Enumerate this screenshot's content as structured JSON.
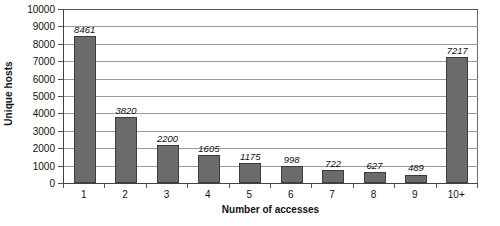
{
  "chart_data": {
    "type": "bar",
    "title": "",
    "xlabel": "Number of accesses",
    "ylabel": "Unique hosts",
    "categories": [
      "1",
      "2",
      "3",
      "4",
      "5",
      "6",
      "7",
      "8",
      "9",
      "10+"
    ],
    "values": [
      8461,
      3820,
      2200,
      1605,
      1175,
      998,
      722,
      627,
      489,
      7217
    ],
    "data_labels": [
      "8461",
      "3820",
      "2200",
      "1605",
      "1175",
      "998",
      "722",
      "627",
      "489",
      "7217"
    ],
    "ylim": [
      0,
      10000
    ],
    "ytick_step": 1000,
    "ytick_labels": [
      "0",
      "1000",
      "2000",
      "3000",
      "4000",
      "5000",
      "6000",
      "7000",
      "8000",
      "9000",
      "10000"
    ],
    "grid": true,
    "grid_axis": "y",
    "legend": null,
    "series_name": "Unique hosts",
    "bar_color": "#6b6b6b",
    "bar_border_color": "#3d3d3d",
    "gridline_color": "#9a9a9a",
    "axis_color": "#444444",
    "background_color": "#ffffff",
    "text_color": "#111111"
  }
}
